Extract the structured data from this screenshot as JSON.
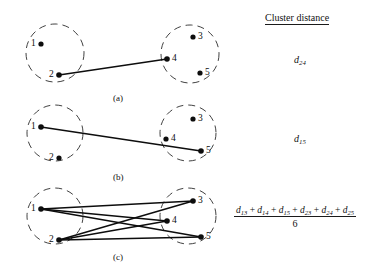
{
  "figure": {
    "type": "cluster-distance-diagram",
    "background_color": "#ffffff",
    "ink_color": "#111111",
    "right_column": {
      "heading": "Cluster distance",
      "heading_underlined": true
    },
    "panels": [
      {
        "id": "a",
        "caption": "(a)",
        "caption_pos": {
          "x": 120,
          "y": 95
        },
        "clusters": [
          {
            "name": "left-cluster",
            "center": {
              "x": 55,
              "y": 53
            },
            "radius": 29,
            "style": "dashed",
            "nodes": [
              {
                "id": "1",
                "label": "1",
                "x": 41,
                "y": 44,
                "label_side": "left"
              },
              {
                "id": "2",
                "label": "2",
                "x": 59,
                "y": 75,
                "label_side": "left"
              }
            ]
          },
          {
            "name": "right-cluster",
            "center": {
              "x": 190,
              "y": 54
            },
            "radius": 29,
            "style": "dashed",
            "nodes": [
              {
                "id": "3",
                "label": "3",
                "x": 193,
                "y": 37,
                "label_side": "right"
              },
              {
                "id": "4",
                "label": "4",
                "x": 167,
                "y": 59,
                "label_side": "right"
              },
              {
                "id": "5",
                "label": "5",
                "x": 200,
                "y": 73,
                "label_side": "right"
              }
            ]
          }
        ],
        "edges": [
          {
            "from": "2",
            "to": "4"
          }
        ],
        "distance_label": "d",
        "distance_subscript": "24",
        "distance_pos": {
          "x": 296,
          "y": 56
        }
      },
      {
        "id": "b",
        "caption": "(b)",
        "caption_pos": {
          "x": 120,
          "y": 174
        },
        "clusters": [
          {
            "name": "left-cluster",
            "center": {
              "x": 55,
              "y": 133
            },
            "radius": 28,
            "style": "dashed",
            "nodes": [
              {
                "id": "1",
                "label": "1",
                "x": 41,
                "y": 127,
                "label_side": "left"
              },
              {
                "id": "2",
                "label": "2",
                "x": 59,
                "y": 158,
                "label_side": "left"
              }
            ]
          },
          {
            "name": "right-cluster",
            "center": {
              "x": 188,
              "y": 133
            },
            "radius": 28,
            "style": "dashed",
            "nodes": [
              {
                "id": "3",
                "label": "3",
                "x": 193,
                "y": 119,
                "label_side": "right"
              },
              {
                "id": "4",
                "label": "4",
                "x": 166,
                "y": 139,
                "label_side": "right"
              },
              {
                "id": "5",
                "label": "5",
                "x": 201,
                "y": 151,
                "label_side": "right"
              }
            ]
          }
        ],
        "edges": [
          {
            "from": "1",
            "to": "5"
          }
        ],
        "distance_label": "d",
        "distance_subscript": "15",
        "distance_pos": {
          "x": 296,
          "y": 135
        }
      },
      {
        "id": "c",
        "caption": "(c)",
        "caption_pos": {
          "x": 120,
          "y": 254
        },
        "clusters": [
          {
            "name": "left-cluster",
            "center": {
              "x": 55,
              "y": 216
            },
            "radius": 28,
            "style": "dashed",
            "nodes": [
              {
                "id": "1",
                "label": "1",
                "x": 41,
                "y": 209,
                "label_side": "left"
              },
              {
                "id": "2",
                "label": "2",
                "x": 59,
                "y": 240,
                "label_side": "left"
              }
            ]
          },
          {
            "name": "right-cluster",
            "center": {
              "x": 188,
              "y": 216,
              "note": ""
            },
            "radius": 28,
            "style": "dashed",
            "nodes": [
              {
                "id": "3",
                "label": "3",
                "x": 193,
                "y": 201,
                "label_side": "right"
              },
              {
                "id": "4",
                "label": "4",
                "x": 167,
                "y": 221,
                "label_side": "right"
              },
              {
                "id": "5",
                "label": "5",
                "x": 201,
                "y": 237,
                "label_side": "right"
              }
            ]
          }
        ],
        "edges": [
          {
            "from": "1",
            "to": "3"
          },
          {
            "from": "1",
            "to": "4"
          },
          {
            "from": "1",
            "to": "5"
          },
          {
            "from": "2",
            "to": "3"
          },
          {
            "from": "2",
            "to": "4"
          },
          {
            "from": "2",
            "to": "5"
          }
        ],
        "distance_formula": {
          "numerator_terms": [
            {
              "base": "d",
              "sub": "13"
            },
            {
              "base": "d",
              "sub": "14"
            },
            {
              "base": "d",
              "sub": "15"
            },
            {
              "base": "d",
              "sub": "23"
            },
            {
              "base": "d",
              "sub": "24"
            },
            {
              "base": "d",
              "sub": "25"
            }
          ],
          "operator": "+",
          "denominator": "6"
        },
        "formula_pos": {
          "x": 237,
          "y": 206
        }
      }
    ]
  }
}
